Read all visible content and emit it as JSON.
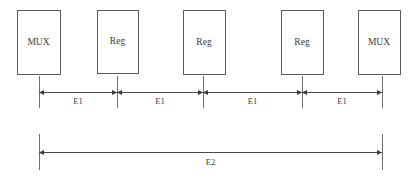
{
  "diagram": {
    "canvas": {
      "width": 417,
      "height": 179,
      "background": "#ffffff"
    },
    "colors": {
      "box_stroke": "#5a5a5a",
      "box_fill": "#ffffff",
      "text": "#3b3b3b",
      "dimension_line": "#4a4a4a",
      "extension_line": "#6e6e6e"
    },
    "blocks": [
      {
        "id": "block-1",
        "label": "MUX",
        "x": 17,
        "y": 10,
        "width": 43,
        "height": 64
      },
      {
        "id": "block-2",
        "label": "Reg",
        "x": 97,
        "y": 10,
        "width": 41,
        "height": 63
      },
      {
        "id": "block-3",
        "label": "Reg",
        "x": 183,
        "y": 10,
        "width": 42,
        "height": 64
      },
      {
        "id": "block-4",
        "label": "Reg",
        "x": 281,
        "y": 10,
        "width": 42,
        "height": 64
      },
      {
        "id": "block-5",
        "label": "MUX",
        "x": 358,
        "y": 10,
        "width": 42,
        "height": 64
      }
    ],
    "extension_lines": [
      {
        "id": "ext-1",
        "x": 39,
        "y1": 76,
        "y2": 108
      },
      {
        "id": "ext-2",
        "x": 117,
        "y1": 76,
        "y2": 108
      },
      {
        "id": "ext-3",
        "x": 203,
        "y1": 76,
        "y2": 108
      },
      {
        "id": "ext-4",
        "x": 302,
        "y1": 76,
        "y2": 108
      },
      {
        "id": "ext-5",
        "x": 382,
        "y1": 76,
        "y2": 108
      },
      {
        "id": "ext-6",
        "x": 39,
        "y1": 134,
        "y2": 170
      },
      {
        "id": "ext-7",
        "x": 382,
        "y1": 134,
        "y2": 170
      }
    ],
    "dimensions_row1": {
      "y": 92,
      "label_y": 104,
      "segments": [
        {
          "id": "dim-e1-a",
          "label": "E1",
          "x1": 39,
          "x2": 117
        },
        {
          "id": "dim-e1-b",
          "label": "E1",
          "x1": 117,
          "x2": 203
        },
        {
          "id": "dim-e1-c",
          "label": "E1",
          "x1": 203,
          "x2": 302
        },
        {
          "id": "dim-e1-d",
          "label": "E1",
          "x1": 302,
          "x2": 382
        }
      ]
    },
    "dimensions_row2": {
      "y": 152,
      "label_y": 165,
      "segments": [
        {
          "id": "dim-e2",
          "label": "E2",
          "x1": 39,
          "x2": 382
        }
      ]
    }
  }
}
